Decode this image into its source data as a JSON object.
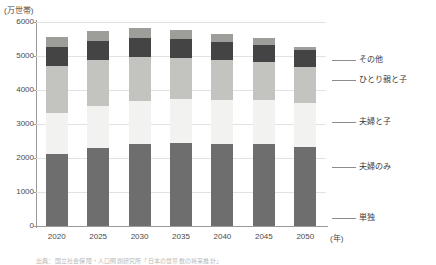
{
  "chart_data": {
    "type": "bar",
    "title": "",
    "subtitle": "",
    "unit_label": "(万世帯)",
    "xlabel": "(年)",
    "ylabel": "",
    "grid": true,
    "stacked": true,
    "legend_position": "right",
    "ylim": [
      0,
      6000
    ],
    "yticks": [
      "0",
      "1000",
      "2000",
      "3000",
      "4000",
      "5000",
      "6000"
    ],
    "categories": [
      "2020",
      "2025",
      "2030",
      "2035",
      "2040",
      "2045",
      "2050"
    ],
    "series": [
      {
        "name": "単独",
        "color": "#6e6e6e",
        "values": [
          2120,
          2300,
          2400,
          2430,
          2420,
          2400,
          2330
        ]
      },
      {
        "name": "夫婦のみ",
        "color": "#f2f2f0",
        "values": [
          1200,
          1240,
          1280,
          1300,
          1300,
          1300,
          1290
        ]
      },
      {
        "name": "夫婦と子",
        "color": "#c3c3c0",
        "values": [
          1400,
          1340,
          1280,
          1210,
          1150,
          1110,
          1070
        ]
      },
      {
        "name": "ひとり親と子",
        "color": "#444444",
        "values": [
          550,
          570,
          570,
          560,
          540,
          510,
          480
        ]
      },
      {
        "name": "その他",
        "color": "#9d9d9a",
        "values": [
          300,
          290,
          280,
          260,
          240,
          220,
          100
        ]
      }
    ],
    "totals": [
      5570,
      5740,
      5810,
      5760,
      5650,
      5540,
      5270
    ],
    "annotations": []
  },
  "legend": {
    "entries": [
      {
        "label": "その他"
      },
      {
        "label": "ひとり親と子"
      },
      {
        "label": "夫婦と子"
      },
      {
        "label": "夫婦のみ"
      },
      {
        "label": "単独"
      }
    ]
  },
  "footnote": {
    "text": "出典：国立社会保障・人口問題研究所「日本の世帯数の将来推計」"
  },
  "colors": {
    "axis": "#9a9a9a",
    "grid": "#e2e2e2",
    "text": "#3a3a3a",
    "background": "#ffffff"
  }
}
